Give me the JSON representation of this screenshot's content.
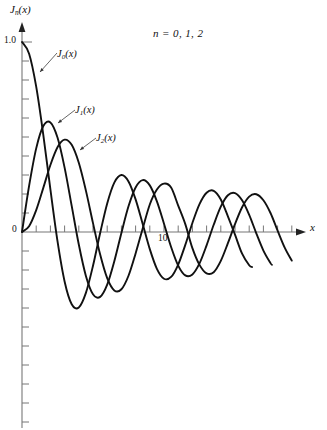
{
  "figure": {
    "kind": "line-plot",
    "background": "#ffffff",
    "ink": "#111111",
    "axis_color": "#777777"
  },
  "labels": {
    "y_axis_label": "J",
    "y_axis_label_sub": "n",
    "y_axis_label_tail": "(x)",
    "x_axis_label": "x",
    "title": "n = 0, 1, 2",
    "curve_j0_main": "J",
    "curve_j0_sub": "0",
    "curve_j0_tail": "(x)",
    "curve_j1_main": "J",
    "curve_j1_sub": "1",
    "curve_j1_tail": "(x)",
    "curve_j2_main": "J",
    "curve_j2_sub": "2",
    "curve_j2_tail": "(x)",
    "tick_1p0": "1.0",
    "tick_0": "0",
    "tick_10": "10"
  },
  "chart_data": {
    "type": "line",
    "title": "n = 0, 1, 2",
    "xlabel": "x",
    "ylabel": "J_n(x)",
    "xlim": [
      0,
      19.7
    ],
    "ylim": [
      -1.0,
      1.05
    ],
    "grid": false,
    "legend": "inline-annotations",
    "x_ticks_labeled": [
      {
        "value": 10,
        "label": "10"
      }
    ],
    "x_tick_step": 1,
    "y_ticks_labeled": [
      {
        "value": 1.0,
        "label": "1.0"
      },
      {
        "value": 0,
        "label": "0"
      }
    ],
    "y_tick_step": 0.1,
    "series": [
      {
        "name": "J_0(x)",
        "color": "#111111",
        "x_start": 0,
        "x_end": 16.2,
        "x": [
          0,
          0.5,
          1,
          1.5,
          2,
          2.5,
          3,
          3.5,
          4,
          4.5,
          5,
          5.5,
          6,
          6.5,
          7,
          7.5,
          8,
          8.5,
          9,
          9.5,
          10,
          10.5,
          11,
          11.5,
          12,
          12.5,
          13,
          13.5,
          14,
          14.5,
          15,
          15.5,
          16,
          16.2
        ],
        "values": [
          1.0,
          0.9385,
          0.7652,
          0.5118,
          0.2239,
          -0.0484,
          -0.2601,
          -0.3801,
          -0.3971,
          -0.3205,
          -0.1776,
          -0.0068,
          0.1506,
          0.2601,
          0.3001,
          0.2663,
          0.1717,
          0.0419,
          -0.0903,
          -0.1939,
          -0.2459,
          -0.2366,
          -0.1712,
          -0.0677,
          0.0477,
          0.1469,
          0.2069,
          0.2167,
          0.1711,
          0.0826,
          -0.0142,
          -0.1142,
          -0.1749,
          -0.184
        ]
      },
      {
        "name": "J_1(x)",
        "color": "#111111",
        "x_start": 0,
        "x_end": 17.6,
        "x": [
          0,
          0.5,
          1,
          1.5,
          2,
          2.5,
          3,
          3.5,
          4,
          4.5,
          5,
          5.5,
          6,
          6.5,
          7,
          7.5,
          8,
          8.5,
          9,
          9.5,
          10,
          10.5,
          11,
          11.5,
          12,
          12.5,
          13,
          13.5,
          14,
          14.5,
          15,
          15.5,
          16,
          16.5,
          17,
          17.5,
          17.6
        ],
        "values": [
          0.0,
          0.2423,
          0.4401,
          0.5579,
          0.5767,
          0.4971,
          0.3391,
          0.1374,
          -0.066,
          -0.2311,
          -0.3276,
          -0.3414,
          -0.2767,
          -0.1538,
          -0.0047,
          0.1352,
          0.2346,
          0.2731,
          0.2453,
          0.1613,
          0.0435,
          -0.0789,
          -0.1768,
          -0.2284,
          -0.2234,
          -0.1655,
          -0.0703,
          0.038,
          0.1334,
          0.1934,
          0.2051,
          0.1672,
          0.0904,
          -0.007,
          -0.0977,
          -0.1638,
          -0.1725
        ]
      },
      {
        "name": "J_2(x)",
        "color": "#111111",
        "x_start": 0,
        "x_end": 19.0,
        "x": [
          0,
          0.5,
          1,
          1.5,
          2,
          2.5,
          3,
          3.5,
          4,
          4.5,
          5,
          5.5,
          6,
          6.5,
          7,
          7.5,
          8,
          8.5,
          9,
          9.5,
          10,
          10.5,
          11,
          11.5,
          12,
          12.5,
          13,
          13.5,
          14,
          14.5,
          15,
          15.5,
          16,
          16.5,
          17,
          17.5,
          18,
          18.5,
          19
        ],
        "values": [
          0.0,
          0.0306,
          0.1149,
          0.2321,
          0.3528,
          0.4461,
          0.4861,
          0.4586,
          0.3641,
          0.2178,
          0.0466,
          -0.1173,
          -0.2429,
          -0.3074,
          -0.3014,
          -0.2303,
          -0.113,
          0.0184,
          0.1448,
          0.2235,
          0.2546,
          0.2341,
          0.139,
          0.0414,
          -0.0849,
          -0.173,
          -0.2177,
          -0.2114,
          -0.152,
          -0.0589,
          0.0416,
          0.1305,
          0.1862,
          0.1988,
          0.167,
          0.0999,
          0.0074,
          -0.082,
          -0.1507
        ]
      }
    ]
  },
  "annotations": [
    {
      "name": "leader-j0",
      "from": [
        57,
        53
      ],
      "to": [
        40,
        72
      ]
    },
    {
      "name": "leader-j1",
      "from": [
        75,
        110
      ],
      "to": [
        58,
        123
      ]
    },
    {
      "name": "leader-j2",
      "from": [
        96,
        138
      ],
      "to": [
        80,
        150
      ]
    }
  ]
}
